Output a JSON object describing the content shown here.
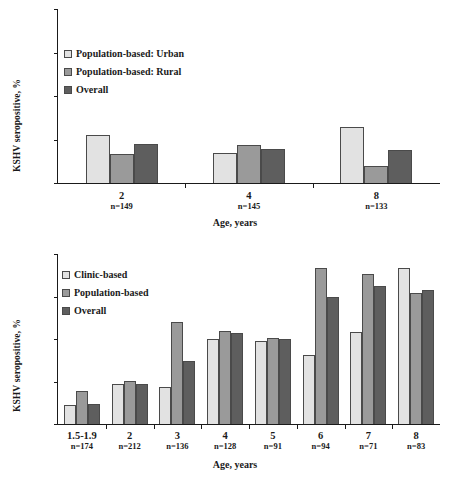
{
  "chart_data": [
    {
      "id": "top",
      "type": "bar",
      "title": "",
      "xlabel": "Age, years",
      "ylabel": "KSHV seropositive, %",
      "ylim": [
        0,
        40
      ],
      "yticks": [
        0,
        10,
        20,
        30,
        40
      ],
      "grid": false,
      "legend_position": "upper-left",
      "categories": [
        "2",
        "4",
        "8"
      ],
      "category_notes": [
        "n=149",
        "n=145",
        "n=133"
      ],
      "series": [
        {
          "name": "Population-based: Urban",
          "color": "#e2e2e2",
          "values": [
            11.0,
            6.8,
            12.9
          ]
        },
        {
          "name": "Population-based: Rural",
          "color": "#9a9a9a",
          "values": [
            6.6,
            8.8,
            4.0
          ]
        },
        {
          "name": "Overall",
          "color": "#5e5e5e",
          "values": [
            8.9,
            7.8,
            7.7
          ]
        }
      ]
    },
    {
      "id": "bottom",
      "type": "bar",
      "title": "",
      "xlabel": "Age, years",
      "ylabel": "KSHV seropositive, %",
      "ylim": [
        0,
        40
      ],
      "yticks": [
        0,
        10,
        20,
        30,
        40
      ],
      "grid": false,
      "legend_position": "upper-left",
      "categories": [
        "1.5-1.9",
        "2",
        "3",
        "4",
        "5",
        "6",
        "7",
        "8"
      ],
      "category_notes": [
        "n=174",
        "n=212",
        "n=136",
        "n=128",
        "n=91",
        "n=94",
        "n=71",
        "n=83"
      ],
      "series": [
        {
          "name": "Clinic-based",
          "color": "#e2e2e2",
          "values": [
            4.4,
            9.3,
            8.7,
            20.1,
            19.6,
            16.2,
            21.6,
            36.6
          ]
        },
        {
          "name": "Population-based",
          "color": "#9a9a9a",
          "values": [
            7.7,
            10.1,
            24.1,
            22.0,
            20.2,
            36.8,
            35.2,
            30.9
          ]
        },
        {
          "name": "Overall",
          "color": "#5e5e5e",
          "values": [
            4.7,
            9.5,
            14.8,
            21.3,
            19.9,
            30.0,
            32.5,
            31.5
          ]
        }
      ]
    }
  ]
}
